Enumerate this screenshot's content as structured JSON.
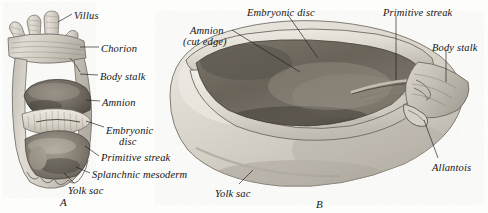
{
  "figure": {
    "kind": "anatomical-illustration",
    "background_color": "#fdfdfc",
    "ink_color": "#141414"
  },
  "panels": [
    {
      "id": "A",
      "letter": "A",
      "caption_x": 60,
      "caption_y": 196
    },
    {
      "id": "B",
      "letter": "B",
      "caption_x": 316,
      "caption_y": 198
    }
  ],
  "labels_panel_a": [
    {
      "name": "villus",
      "text": "Villus",
      "x": 74,
      "y": 10,
      "align": "left"
    },
    {
      "name": "chorion",
      "text": "Chorion",
      "x": 101,
      "y": 43,
      "align": "left"
    },
    {
      "name": "body-stalk",
      "text": "Body stalk",
      "x": 100,
      "y": 71,
      "align": "left"
    },
    {
      "name": "amnion",
      "text": "Amnion",
      "x": 102,
      "y": 97,
      "align": "left"
    },
    {
      "name": "embryonic-disc-1",
      "text": "Embryonic",
      "x": 106,
      "y": 125,
      "align": "left"
    },
    {
      "name": "embryonic-disc-2",
      "text": "disc",
      "x": 119,
      "y": 136,
      "align": "left"
    },
    {
      "name": "primitive-streak",
      "text": "Primitive streak",
      "x": 101,
      "y": 152,
      "align": "left"
    },
    {
      "name": "splanchnic-mesoderm",
      "text": "Splanchnic mesoderm",
      "x": 92,
      "y": 169,
      "align": "left"
    },
    {
      "name": "yolk-sac",
      "text": "Yolk sac",
      "x": 68,
      "y": 185,
      "align": "left"
    }
  ],
  "labels_panel_b": [
    {
      "name": "amnion-cut-edge-1",
      "text": "Amnion",
      "x": 190,
      "y": 25,
      "align": "left"
    },
    {
      "name": "amnion-cut-edge-2",
      "text": "(cut edge)",
      "x": 183,
      "y": 36,
      "align": "left"
    },
    {
      "name": "embryonic-disc",
      "text": "Embryonic disc",
      "x": 247,
      "y": 7,
      "align": "left"
    },
    {
      "name": "primitive-streak",
      "text": "Primitive streak",
      "x": 383,
      "y": 7,
      "align": "left"
    },
    {
      "name": "body-stalk",
      "text": "Body stalk",
      "x": 432,
      "y": 42,
      "align": "left"
    },
    {
      "name": "allantois",
      "text": "Allantois",
      "x": 432,
      "y": 162,
      "align": "left"
    },
    {
      "name": "yolk-sac",
      "text": "Yolk sac",
      "x": 215,
      "y": 188,
      "align": "left"
    }
  ],
  "leaders": [
    {
      "name": "leader-villus",
      "points": "72,14 58,22"
    },
    {
      "name": "leader-chorion",
      "points": "99,47 80,47"
    },
    {
      "name": "leader-body-stalk",
      "points": "98,75 80,74"
    },
    {
      "name": "leader-amnion",
      "points": "100,101 86,100"
    },
    {
      "name": "leader-embryonic-disc",
      "points": "104,127 86,121"
    },
    {
      "name": "leader-primitive-streak",
      "points": "99,156 85,146"
    },
    {
      "name": "leader-splanchnic-mesoderm",
      "points": "90,173 76,167"
    },
    {
      "name": "leader-yolk-sac-a",
      "points": "74,183 64,173"
    },
    {
      "name": "leader-amnion-cut-edge",
      "points": "232,30 300,72"
    },
    {
      "name": "leader-embryonic-disc-b",
      "points": "288,15 318,58"
    },
    {
      "name": "leader-primitive-streak-b",
      "points": "396,16 396,80"
    },
    {
      "name": "leader-body-stalk-b",
      "points": "446,50 446,82"
    },
    {
      "name": "leader-allantois",
      "points": "438,158 424,120"
    },
    {
      "name": "leader-yolk-sac-b",
      "points": "239,184 253,170"
    }
  ]
}
